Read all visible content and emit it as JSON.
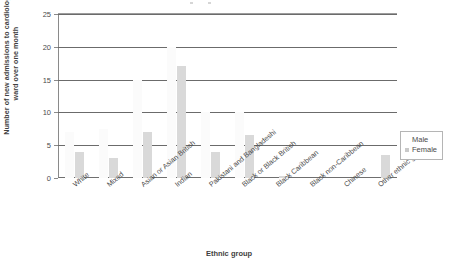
{
  "chart_data": {
    "type": "bar",
    "title": "",
    "xlabel": "Ethnic group",
    "ylabel": "Number of new admissions to cardiology ward over one month",
    "ylim": [
      0,
      25
    ],
    "yticks": [
      0,
      5,
      10,
      15,
      20,
      25
    ],
    "grid": true,
    "legend_position": "right",
    "categories": [
      "White",
      "Mixed",
      "Asian or Asian British",
      "Indian",
      "Pakistani and Bangladeshi",
      "Black or Black British",
      "Black Caribbean",
      "Black non-Caribbean",
      "Chinese",
      "Other ethnic groups"
    ],
    "series": [
      {
        "name": "Male",
        "color": "#fbfbfb",
        "values": [
          7,
          7.5,
          15,
          20,
          10,
          10,
          0,
          0,
          0,
          0
        ]
      },
      {
        "name": "Female",
        "color": "#d9d9d9",
        "values": [
          4,
          3,
          7,
          17,
          4,
          6.5,
          0.3,
          0,
          0,
          3.5
        ]
      }
    ]
  },
  "legend": {
    "entries": [
      {
        "label": "Male"
      },
      {
        "label": "Female"
      }
    ]
  }
}
